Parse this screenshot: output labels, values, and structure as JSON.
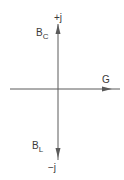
{
  "diagram": {
    "type": "admittance-phasor-axes",
    "axis_color": "#5a5a5a",
    "labels": {
      "pos_imag": "+j",
      "neg_imag": "−j",
      "capacitive_main": "B",
      "capacitive_sub": "C",
      "inductive_main": "B",
      "inductive_sub": "L",
      "real": "G"
    }
  }
}
